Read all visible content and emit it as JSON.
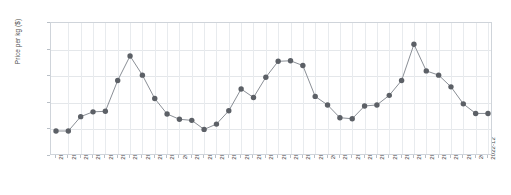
{
  "chart_data": {
    "type": "line",
    "title": "",
    "xlabel": "",
    "ylabel": "Price per kg ($)",
    "ylim": [
      0,
      25
    ],
    "yticks": [
      0,
      5,
      10,
      15,
      20,
      25
    ],
    "grid": true,
    "legend": "none",
    "marker": "circle",
    "line_color": "#8a8f96",
    "marker_color": "#5c6066",
    "categories": [
      "2020-01",
      "2020-02",
      "2020-03",
      "2020-04",
      "2020-05",
      "2020-06",
      "2020-07",
      "2020-08",
      "2020-09",
      "2020-10",
      "2020-11",
      "2020-12",
      "2021-01",
      "2021-02",
      "2021-03",
      "2021-04",
      "2021-05",
      "2021-06",
      "2021-07",
      "2021-08",
      "2021-09",
      "2021-10",
      "2021-11",
      "2021-12",
      "2022-01",
      "2022-02",
      "2022-03",
      "2022-04",
      "2022-05",
      "2022-06",
      "2022-07",
      "2022-08",
      "2022-09",
      "2022-10",
      "2022-11",
      "2022-12"
    ],
    "values": [
      4.7,
      4.7,
      7.4,
      8.3,
      8.4,
      14.2,
      18.8,
      15.2,
      10.8,
      7.9,
      6.9,
      6.7,
      5.0,
      6.0,
      8.5,
      12.6,
      11.0,
      14.8,
      17.8,
      17.9,
      17.0,
      11.2,
      9.6,
      7.2,
      7.0,
      9.4,
      9.6,
      11.4,
      14.2,
      21.0,
      16.0,
      15.2,
      13.0,
      9.8,
      8.0,
      8.0
    ]
  }
}
